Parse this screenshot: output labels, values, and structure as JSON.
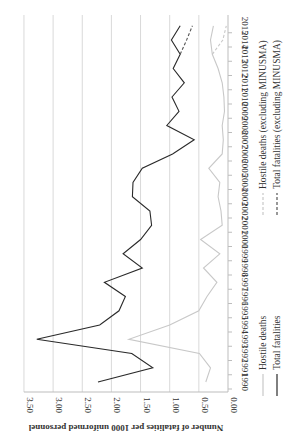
{
  "chart_data": {
    "type": "line",
    "orientation": "rotated 90 degrees counter-clockwise (years run bottom-to-top, values increase to the left)",
    "title": "",
    "xlabel": "",
    "ylabel": "Number of fatalities per 1000 uniformed personnel",
    "ylim": [
      0,
      3.5
    ],
    "yticks": [
      "0.00",
      "0.50",
      "1.00",
      "1.50",
      "2.00",
      "2.50",
      "3.00",
      "3.50"
    ],
    "grid": true,
    "legend_position": "bottom",
    "categories": [
      "1990",
      "1991",
      "1992",
      "1993",
      "1994",
      "1995",
      "1996",
      "1997",
      "1998",
      "1999",
      "2000",
      "2001",
      "2002",
      "2003",
      "2004",
      "2005",
      "2006",
      "2007",
      "2008",
      "2009",
      "2010",
      "2011",
      "2012",
      "2013",
      "2014",
      "2015"
    ],
    "series": [
      {
        "name": "Hostile deaths",
        "style": "solid",
        "color": "#c8c8c8",
        "values": [
          0.38,
          0.3,
          0.49,
          1.7,
          1.0,
          0.5,
          0.36,
          0.19,
          0.42,
          0.14,
          0.47,
          0.1,
          0.12,
          0.17,
          0.14,
          0.33,
          0.1,
          0.08,
          0.1,
          0.06,
          0.07,
          0.1,
          0.17,
          0.27,
          0.3,
          0.25
        ]
      },
      {
        "name": "Total fatalities",
        "style": "solid",
        "color": "#2a2a2a",
        "values": [
          2.23,
          1.29,
          1.65,
          3.28,
          2.2,
          1.87,
          1.76,
          2.12,
          1.47,
          1.8,
          1.5,
          1.31,
          1.34,
          1.64,
          1.63,
          1.47,
          0.95,
          0.58,
          1.05,
          0.84,
          0.96,
          0.75,
          0.94,
          0.82,
          0.97,
          0.82
        ]
      },
      {
        "name": "Hostile deaths (excluding MINUSMA)",
        "style": "dashed",
        "color": "#c8c8c8",
        "values": [
          null,
          null,
          null,
          null,
          null,
          null,
          null,
          null,
          null,
          null,
          null,
          null,
          null,
          null,
          null,
          null,
          null,
          null,
          null,
          null,
          null,
          null,
          null,
          0.27,
          0.09,
          0.03
        ]
      },
      {
        "name": "Total fatalities (excluding MINUSMA)",
        "style": "dashed",
        "color": "#555555",
        "values": [
          null,
          null,
          null,
          null,
          null,
          null,
          null,
          null,
          null,
          null,
          null,
          null,
          null,
          null,
          null,
          null,
          null,
          null,
          null,
          null,
          null,
          null,
          null,
          0.82,
          0.71,
          0.61
        ]
      }
    ]
  },
  "legend": {
    "left_group": [
      "Hostile deaths",
      "Total fatalities"
    ],
    "right_group": [
      "Hostile deaths (excluding MINUSMA)",
      "Total fatalities (excluding MINUSMA)"
    ]
  }
}
